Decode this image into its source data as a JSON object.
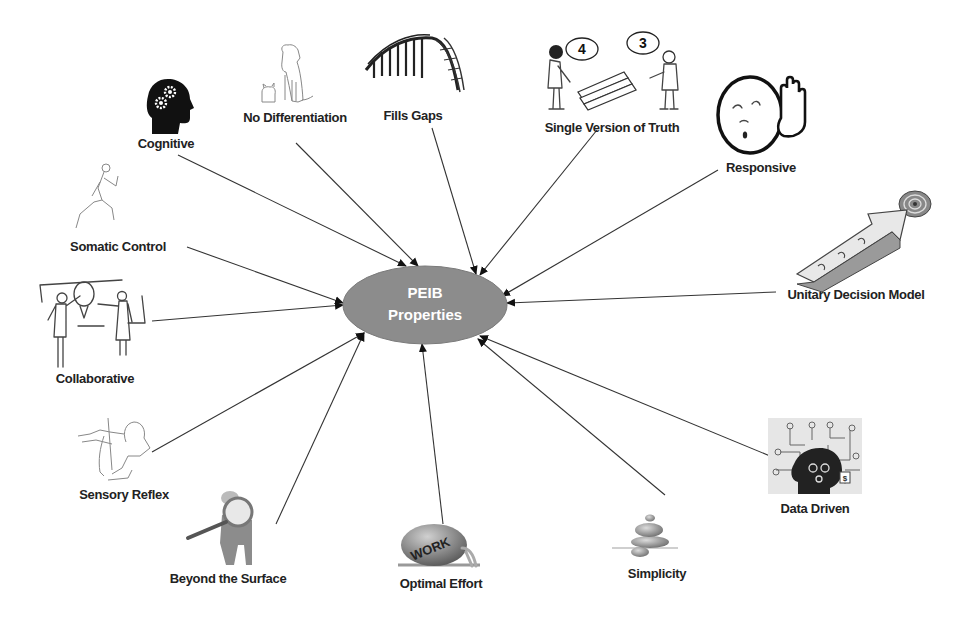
{
  "hub": {
    "line1": "PEIB",
    "line2": "Properties",
    "fill": "#8c8c8c",
    "text_color": "#ffffff"
  },
  "nodes": [
    {
      "id": "cognitive",
      "label": "Cognitive",
      "icon": "head-with-gears-icon"
    },
    {
      "id": "no-differentiation",
      "label": "No Differentiation",
      "icon": "dog-and-cat-icon"
    },
    {
      "id": "fills-gaps",
      "label": "Fills Gaps",
      "icon": "bridge-icon"
    },
    {
      "id": "single-version-of-truth",
      "label": "Single Version of Truth",
      "icon": "two-people-disagreeing-icon",
      "bubbles": [
        "4",
        "3"
      ]
    },
    {
      "id": "responsive",
      "label": "Responsive",
      "icon": "face-with-raised-hand-icon"
    },
    {
      "id": "unitary-decision-model",
      "label": "Unitary Decision Model",
      "icon": "puzzle-arrow-target-icon"
    },
    {
      "id": "data-driven",
      "label": "Data Driven",
      "icon": "data-head-icon"
    },
    {
      "id": "simplicity",
      "label": "Simplicity",
      "icon": "stacked-stones-icon"
    },
    {
      "id": "optimal-effort",
      "label": "Optimal Effort",
      "icon": "pushing-work-boulder-icon",
      "boulder_text": "WORK"
    },
    {
      "id": "beyond-the-surface",
      "label": "Beyond the Surface",
      "icon": "magnifying-glass-figure-icon"
    },
    {
      "id": "sensory-reflex",
      "label": "Sensory Reflex",
      "icon": "reflex-arm-icon"
    },
    {
      "id": "collaborative",
      "label": "Collaborative",
      "icon": "people-at-whiteboard-icon"
    },
    {
      "id": "somatic-control",
      "label": "Somatic Control",
      "icon": "running-man-icon"
    }
  ]
}
